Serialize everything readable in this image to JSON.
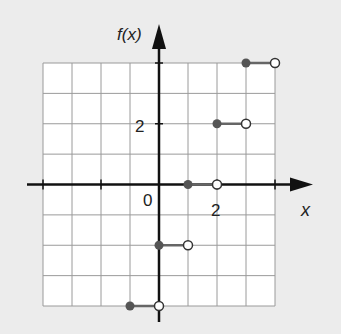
{
  "chart_data": {
    "type": "line",
    "subtype": "step-function",
    "title": "",
    "xlabel": "x",
    "ylabel": "f(x)",
    "xlim": [
      -4,
      4
    ],
    "ylim": [
      -4,
      4
    ],
    "grid": true,
    "grid_step": 1,
    "x_tick_labels": [
      {
        "value": 0,
        "label": "0"
      },
      {
        "value": 2,
        "label": "2"
      }
    ],
    "y_tick_labels": [
      {
        "value": 2,
        "label": "2"
      }
    ],
    "x_ticks": [
      -4,
      -2,
      0,
      2,
      4
    ],
    "y_ticks": [
      2,
      4
    ],
    "segments": [
      {
        "x_start": -1,
        "x_end": 0,
        "y": -4,
        "start": "closed",
        "end": "open"
      },
      {
        "x_start": 0,
        "x_end": 1,
        "y": -2,
        "start": "closed",
        "end": "open"
      },
      {
        "x_start": 1,
        "x_end": 2,
        "y": 0,
        "start": "closed",
        "end": "open"
      },
      {
        "x_start": 2,
        "x_end": 3,
        "y": 2,
        "start": "closed",
        "end": "open"
      },
      {
        "x_start": 3,
        "x_end": 4,
        "y": 4,
        "start": "closed",
        "end": "open"
      }
    ],
    "colors": {
      "background": "#ececec",
      "plot_area": "#ffffff",
      "grid": "#9a9a9a",
      "axes": "#111111",
      "segment": "#666666",
      "closed_point": "#555555",
      "open_point_fill": "#ffffff",
      "open_point_stroke": "#333333"
    }
  },
  "labels": {
    "y_axis": "f(x)",
    "x_axis": "x",
    "origin": "0",
    "x_two": "2",
    "y_two": "2"
  }
}
